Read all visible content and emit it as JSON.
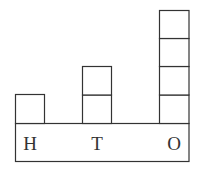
{
  "diagram": {
    "type": "place-value-blocks",
    "columns": [
      {
        "label": "H",
        "count": 1
      },
      {
        "label": "T",
        "count": 2
      },
      {
        "label": "O",
        "count": 4
      }
    ],
    "stroke_color": "#333333",
    "background": "#ffffff"
  }
}
